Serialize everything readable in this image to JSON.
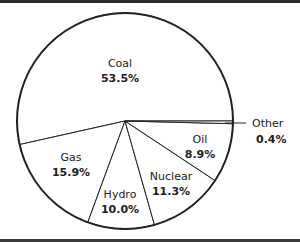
{
  "chart_data": {
    "type": "pie",
    "title": "",
    "categories": [
      "Coal",
      "Gas",
      "Hydro",
      "Nuclear",
      "Oil",
      "Other"
    ],
    "values": [
      53.5,
      15.9,
      10.0,
      11.3,
      8.9,
      0.4
    ],
    "unit": "%",
    "labels": [
      {
        "name": "Coal",
        "value": "53.5%"
      },
      {
        "name": "Gas",
        "value": "15.9%"
      },
      {
        "name": "Hydro",
        "value": "10.0%"
      },
      {
        "name": "Nuclear",
        "value": "11.3%"
      },
      {
        "name": "Oil",
        "value": "8.9%"
      },
      {
        "name": "Other",
        "value": "0.4%"
      }
    ],
    "start_angle_deg": 0,
    "direction": "counterclockwise",
    "fill_color": "#ffffff",
    "stroke_color": "#222222",
    "legend": "none (direct labels; 'Other' uses leader line)"
  }
}
